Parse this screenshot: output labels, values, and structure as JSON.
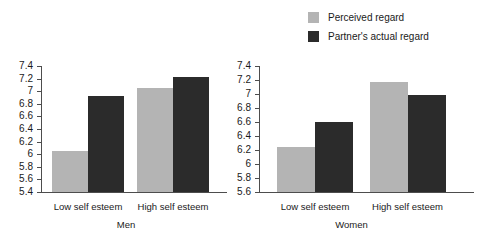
{
  "chart_data": {
    "type": "bar",
    "title": "",
    "subtitle": "",
    "xlabel": "",
    "ylabel": "",
    "grid": false,
    "legend_position": "top-right",
    "legend": [
      {
        "name": "Perceived regard",
        "color": "#b4b4b4"
      },
      {
        "name": "Partner's actual regard",
        "color": "#2b2b2b"
      }
    ],
    "panels": [
      {
        "title": "Men",
        "categories": [
          "Low self esteem",
          "High self esteem"
        ],
        "ylim": [
          5.4,
          7.4
        ],
        "ytick_step": 0.2,
        "yticks": [
          "7.4",
          "7.2",
          "7",
          "6.8",
          "6.6",
          "6.4",
          "6.2",
          "6",
          "5.8",
          "5.6",
          "5.4"
        ],
        "series": [
          {
            "name": "Perceived regard",
            "color": "#b4b4b4",
            "values": [
              6.05,
              7.05
            ]
          },
          {
            "name": "Partner's actual regard",
            "color": "#2b2b2b",
            "values": [
              6.93,
              7.23
            ]
          }
        ]
      },
      {
        "title": "Women",
        "categories": [
          "Low self esteem",
          "High self esteem"
        ],
        "ylim": [
          5.6,
          7.4
        ],
        "ytick_step": 0.2,
        "yticks": [
          "7.4",
          "7.2",
          "7",
          "6.8",
          "6.6",
          "6.4",
          "6.2",
          "6",
          "5.8",
          "5.6"
        ],
        "series": [
          {
            "name": "Perceived regard",
            "color": "#b4b4b4",
            "values": [
              6.25,
              7.17
            ]
          },
          {
            "name": "Partner's actual regard",
            "color": "#2b2b2b",
            "values": [
              6.6,
              6.98
            ]
          }
        ]
      }
    ]
  }
}
